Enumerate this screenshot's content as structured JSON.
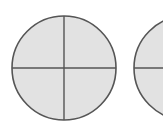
{
  "diagram": {
    "fill_color": "#e2e2e2",
    "stroke_color": "#555555",
    "circles": [
      {
        "cx": 64,
        "cy": 68,
        "r": 52,
        "parts": 4
      },
      {
        "cx": 186,
        "cy": 68,
        "r": 52,
        "parts": 4
      }
    ]
  }
}
